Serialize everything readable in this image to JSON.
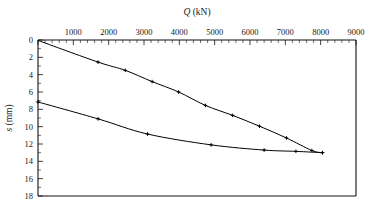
{
  "chart_data": {
    "type": "line",
    "title": "Q (kN)",
    "title_italic_part": "Q",
    "title_rest": " (kN)",
    "xlabel": "Q (kN)",
    "ylabel": "s (mm)",
    "ylabel_italic_part": "s",
    "ylabel_rest": " (mm)",
    "x_axis_position": "top",
    "y_axis_direction": "inverted",
    "xlim": [
      0,
      9000
    ],
    "ylim": [
      0,
      18
    ],
    "x_ticks": [
      0,
      1000,
      2000,
      3000,
      4000,
      5000,
      6000,
      7000,
      8000,
      9000
    ],
    "x_tick_labels": [
      "",
      "1000",
      "2000",
      "3000",
      "4000",
      "5000",
      "6000",
      "7000",
      "8000",
      "9000"
    ],
    "x_minor_tick_step": 200,
    "y_ticks": [
      0,
      2,
      4,
      6,
      8,
      10,
      12,
      14,
      16,
      18
    ],
    "y_tick_labels": [
      "0",
      "2",
      "4",
      "6",
      "8",
      "10",
      "12",
      "14",
      "16",
      "18"
    ],
    "y_minor_tick_step": 1,
    "grid": false,
    "legend": null,
    "series": [
      {
        "name": "loading curve",
        "marker": "plus",
        "x": [
          0,
          1700,
          2470,
          3230,
          3980,
          4740,
          5510,
          6270,
          7030,
          7750,
          8050
        ],
        "y": [
          0.05,
          2.55,
          3.5,
          4.8,
          6.0,
          7.55,
          8.7,
          9.95,
          11.3,
          12.75,
          13.0
        ]
      },
      {
        "name": "unloading / rebound curve",
        "marker": "plus",
        "x": [
          0,
          1700,
          3100,
          4900,
          6400,
          7300,
          8050
        ],
        "y": [
          7.15,
          9.1,
          10.85,
          12.1,
          12.7,
          12.85,
          13.0
        ]
      }
    ]
  }
}
